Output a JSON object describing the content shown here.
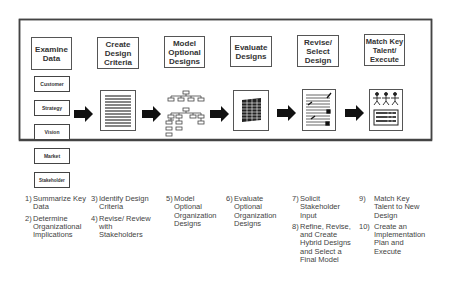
{
  "phases": [
    {
      "title": "Examine Data",
      "icon": "data-category-boxes-icon"
    },
    {
      "title": "Create Design Criteria",
      "icon": "document-lines-icon"
    },
    {
      "title": "Model Optional Designs",
      "icon": "org-chart-icon"
    },
    {
      "title": "Evaluate Designs",
      "icon": "stacked-grid-icon"
    },
    {
      "title": "Revise/ Select Design",
      "icon": "checked-document-icon"
    },
    {
      "title": "Match Key Talent/ Execute",
      "icon": "people-board-icon"
    }
  ],
  "data_categories": [
    "Customer",
    "Strategy",
    "Vision",
    "Market",
    "Stakeholder"
  ],
  "steps": [
    [
      {
        "num": "1)",
        "text": "Summarize Key Data"
      },
      {
        "num": "2)",
        "text": "Determine Organizational Implications"
      }
    ],
    [
      {
        "num": "3)",
        "text": "Identify Design Criteria"
      },
      {
        "num": "4)",
        "text": "Revise/ Review with Stakeholders"
      }
    ],
    [
      {
        "num": "5)",
        "text": "Model Optional Organization Designs"
      }
    ],
    [
      {
        "num": "6)",
        "text": "Evaluate Optional Organization Designs"
      }
    ],
    [
      {
        "num": "7)",
        "text": "Solicit Stakeholder Input"
      },
      {
        "num": "8)",
        "text": "Refine, Revise, and Create Hybrid Designs and Select a Final Model"
      }
    ],
    [
      {
        "num": "9)",
        "text": "Match Key Talent to New Design"
      },
      {
        "num": "10)",
        "text": "Create an Implementation Plan and Execute"
      }
    ]
  ],
  "colors": {
    "border": "#333333",
    "arrow": "#111111",
    "text": "#444444"
  }
}
